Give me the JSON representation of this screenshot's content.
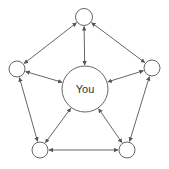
{
  "diagram": {
    "type": "network",
    "center_label": "You",
    "colors": {
      "stroke": "#555555",
      "background": "#ffffff",
      "text": "#333333"
    },
    "nodes": [
      {
        "id": "center",
        "label": "You",
        "cx": 85,
        "cy": 89,
        "r": 23
      },
      {
        "id": "top",
        "label": "",
        "cx": 84,
        "cy": 17,
        "r": 8.5
      },
      {
        "id": "left",
        "label": "",
        "cx": 17,
        "cy": 69,
        "r": 8
      },
      {
        "id": "right",
        "label": "",
        "cx": 152,
        "cy": 68,
        "r": 8
      },
      {
        "id": "bottom-left",
        "label": "",
        "cx": 40,
        "cy": 150,
        "r": 8
      },
      {
        "id": "bottom-right",
        "label": "",
        "cx": 127,
        "cy": 150,
        "r": 8
      }
    ],
    "edges": [
      {
        "from": "top",
        "to": "center",
        "bidirectional": true
      },
      {
        "from": "left",
        "to": "center",
        "bidirectional": true
      },
      {
        "from": "right",
        "to": "center",
        "bidirectional": true
      },
      {
        "from": "bottom-left",
        "to": "center",
        "bidirectional": true
      },
      {
        "from": "bottom-right",
        "to": "center",
        "bidirectional": true
      },
      {
        "from": "top",
        "to": "left",
        "bidirectional": true
      },
      {
        "from": "top",
        "to": "right",
        "bidirectional": true
      },
      {
        "from": "left",
        "to": "bottom-left",
        "bidirectional": true
      },
      {
        "from": "right",
        "to": "bottom-right",
        "bidirectional": true
      },
      {
        "from": "bottom-left",
        "to": "bottom-right",
        "bidirectional": true
      }
    ]
  }
}
